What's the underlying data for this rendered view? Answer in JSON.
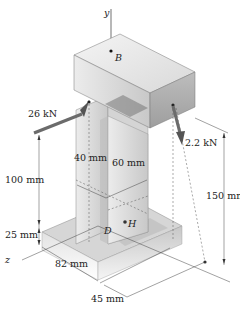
{
  "diagram": {
    "type": "3d-mechanics-figure",
    "axes": {
      "y": "y",
      "z": "z"
    },
    "points": {
      "B": "B",
      "H": "H",
      "D": "D"
    },
    "loads": [
      {
        "id": "load-left",
        "label": "26 kN"
      },
      {
        "id": "load-right",
        "label": "2.2 kN"
      }
    ],
    "dimensions": {
      "d100": "100 mm",
      "d25": "25 mm",
      "d40": "40 mm",
      "d60": "60 mm",
      "d82": "82 mm",
      "d45": "45 mm",
      "d150": "150 mm"
    },
    "colors": {
      "arrow": "#6b6b6b",
      "body_light": "#e8e8e8",
      "body_mid": "#cfcfcf",
      "body_dark": "#a9a9a9",
      "line": "#333333"
    }
  }
}
